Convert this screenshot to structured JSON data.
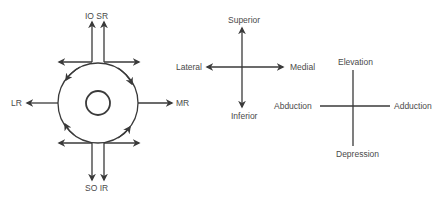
{
  "figure": {
    "type": "eye-movement-diagram",
    "panels": [
      {
        "id": "muscle-actions",
        "labels": {
          "top": "IO SR",
          "bottom": "SO IR",
          "left": "LR",
          "right": "MR"
        }
      },
      {
        "id": "anatomical-directions",
        "labels": {
          "top": "Superior",
          "bottom": "Inferior",
          "left": "Lateral",
          "right": "Medial"
        }
      },
      {
        "id": "eye-movements",
        "labels": {
          "top": "Elevation",
          "bottom": "Depression",
          "left": "Abduction",
          "right": "Adduction"
        }
      }
    ]
  },
  "colors": {
    "stroke": "#3a3a3a",
    "text": "#4a4a4a",
    "background": "#ffffff"
  }
}
